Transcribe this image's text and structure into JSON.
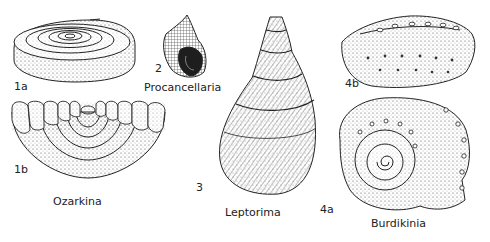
{
  "plate": {
    "figures": [
      {
        "id": "1a",
        "genus": "Ozarkina",
        "view": "apical spiral view"
      },
      {
        "id": "1b",
        "genus": "Ozarkina",
        "view": "basal view"
      },
      {
        "id": "2",
        "genus": "Procancellaria",
        "view": "apertural view"
      },
      {
        "id": "3",
        "genus": "Leptorima",
        "view": "apertural view"
      },
      {
        "id": "4a",
        "genus": "Burdikinia",
        "view": "apical view"
      },
      {
        "id": "4b",
        "genus": "Burdikinia",
        "view": "side view"
      }
    ],
    "labels": {
      "fig1a": "1a",
      "fig1b": "1b",
      "fig2": "2",
      "fig3": "3",
      "fig4a": "4a",
      "fig4b": "4b",
      "genus1": "Ozarkina",
      "genus2": "Procancellaria",
      "genus3": "Leptorima",
      "genus4": "Burdikinia"
    }
  }
}
